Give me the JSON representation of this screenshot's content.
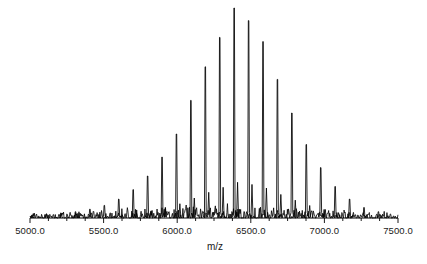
{
  "figure": {
    "background_color": "#ffffff",
    "trace_color": "#000000",
    "axis_color": "#000000"
  },
  "axis": {
    "title": "m/z",
    "title_x_px": 215,
    "title_y_px": 241,
    "line_y_px": 218,
    "line_x_start_px": 30,
    "line_x_end_px": 398,
    "tick_labels": [
      "5000.0",
      "5500.0",
      "6000.0",
      "6500.0",
      "7000.0",
      "7500.0"
    ],
    "tick_values": [
      5000,
      5500,
      6000,
      6500,
      7000,
      7500
    ],
    "minor_tick_interval": 125,
    "tick_length_px": 4
  },
  "chart_data": {
    "type": "line",
    "title": "",
    "xlabel": "m/z",
    "ylabel": "",
    "xlim": [
      5000,
      7500
    ],
    "ylim": [
      0,
      100
    ],
    "grid": false,
    "legend": null,
    "peak_spacing_mz": 98,
    "envelope_center_mz": 6250,
    "envelope_sigma_mz": 400,
    "noise_amplitude_pct": 2.2,
    "peaks": [
      {
        "mz": 5015,
        "intensity": 1.5
      },
      {
        "mz": 5113,
        "intensity": 1.8
      },
      {
        "mz": 5211,
        "intensity": 2.2
      },
      {
        "mz": 5309,
        "intensity": 3.0
      },
      {
        "mz": 5407,
        "intensity": 4.2
      },
      {
        "mz": 5505,
        "intensity": 6.0
      },
      {
        "mz": 5603,
        "intensity": 9.0
      },
      {
        "mz": 5701,
        "intensity": 13.5
      },
      {
        "mz": 5799,
        "intensity": 20.0
      },
      {
        "mz": 5897,
        "intensity": 29.0
      },
      {
        "mz": 5995,
        "intensity": 40.0
      },
      {
        "mz": 6093,
        "intensity": 56.0
      },
      {
        "mz": 6191,
        "intensity": 72.0
      },
      {
        "mz": 6289,
        "intensity": 86.0
      },
      {
        "mz": 6387,
        "intensity": 100.0
      },
      {
        "mz": 6485,
        "intensity": 94.0
      },
      {
        "mz": 6583,
        "intensity": 84.0
      },
      {
        "mz": 6681,
        "intensity": 66.0
      },
      {
        "mz": 6779,
        "intensity": 50.0
      },
      {
        "mz": 6877,
        "intensity": 35.0
      },
      {
        "mz": 6975,
        "intensity": 24.0
      },
      {
        "mz": 7073,
        "intensity": 15.0
      },
      {
        "mz": 7171,
        "intensity": 9.0
      },
      {
        "mz": 7269,
        "intensity": 5.0
      },
      {
        "mz": 7367,
        "intensity": 3.0
      }
    ]
  }
}
